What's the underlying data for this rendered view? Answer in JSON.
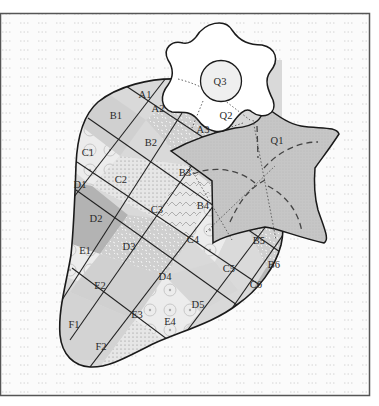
{
  "figure": {
    "background_color": "#fbfbfb",
    "frame_color": "#555555",
    "line_color": "#222222",
    "flower_fill": "#ffffff",
    "star_fill": "#c8c8c8"
  },
  "labels": {
    "A1": "A1",
    "A2": "A2",
    "A3": "A3",
    "B1": "B1",
    "B2": "B2",
    "B3": "B3",
    "B4": "B4",
    "B5": "B5",
    "B6": "B6",
    "C1": "C1",
    "C2": "C2",
    "C3": "C3",
    "C4": "C4",
    "C5": "C5",
    "C6": "C6",
    "D1": "D1",
    "D2": "D2",
    "D3": "D3",
    "D4": "D4",
    "D5": "D5",
    "E1": "E1",
    "E2": "E2",
    "E3": "E3",
    "E4": "E4",
    "F1": "F1",
    "F2": "F2",
    "Q1": "Q1",
    "Q2": "Q2",
    "Q3": "Q3"
  },
  "pieces": {
    "strawberry_body": "diamond-grid pieced strawberry with rows A–F",
    "leaf_star": "Q1 five-pointed leaf calyx with dashed quilting lines",
    "flower": "Q2 scalloped flower with Q3 circular center"
  }
}
